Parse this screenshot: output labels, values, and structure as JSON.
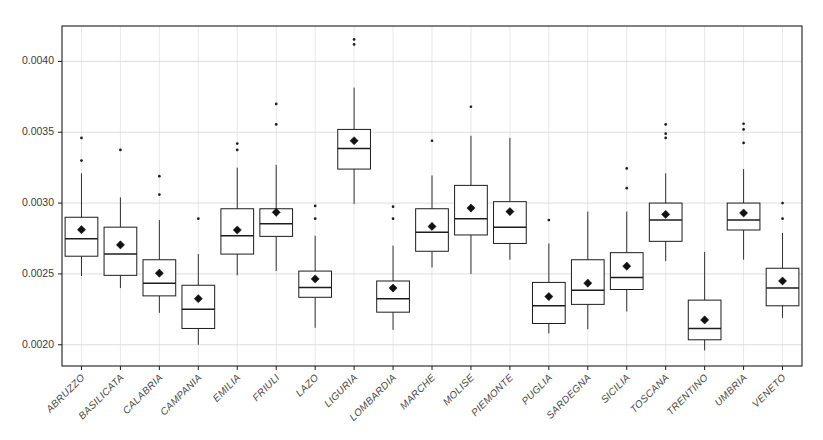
{
  "chart_data": {
    "type": "box",
    "title": "",
    "xlabel": "",
    "ylabel": "",
    "ylim": [
      0.00185,
      0.00425
    ],
    "yticks": [
      0.002,
      0.0025,
      0.003,
      0.0035,
      0.004
    ],
    "ytick_labels": [
      "0.0020",
      "0.0025",
      "0.0030",
      "0.0035",
      "0.0040"
    ],
    "grid": "horizontal-and-vertical",
    "legend": "none",
    "mean_marker": "filled-diamond",
    "categories": [
      "ABRUZZO",
      "BASILICATA",
      "CALABRIA",
      "CAMPANIA",
      "EMILIA",
      "FRIULI",
      "LAZO",
      "LIGURIA",
      "LOMBARDIA",
      "MARCHE",
      "MOLISE",
      "PIEMONTE",
      "PUGLIA",
      "SARDEGNA",
      "SICILIA",
      "TOSCANA",
      "TRENTINO",
      "UMBRIA",
      "VENETO"
    ],
    "boxes": [
      {
        "category": "ABRUZZO",
        "whisker_low": 0.002485,
        "q1": 0.002625,
        "median": 0.002748,
        "q3": 0.0029,
        "whisker_high": 0.00321,
        "mean": 0.002812,
        "outliers": [
          0.0033,
          0.00346
        ]
      },
      {
        "category": "BASILICATA",
        "whisker_low": 0.0024,
        "q1": 0.00249,
        "median": 0.00264,
        "q3": 0.00283,
        "whisker_high": 0.00304,
        "mean": 0.002705,
        "outliers": [
          0.003375
        ]
      },
      {
        "category": "CALABRIA",
        "whisker_low": 0.002225,
        "q1": 0.002345,
        "median": 0.002435,
        "q3": 0.0026,
        "whisker_high": 0.00288,
        "mean": 0.002505,
        "outliers": [
          0.00306,
          0.00319
        ]
      },
      {
        "category": "CAMPANIA",
        "whisker_low": 0.002,
        "q1": 0.002115,
        "median": 0.00225,
        "q3": 0.00242,
        "whisker_high": 0.00264,
        "mean": 0.002325,
        "outliers": [
          0.00289
        ]
      },
      {
        "category": "EMILIA",
        "whisker_low": 0.00249,
        "q1": 0.00264,
        "median": 0.00277,
        "q3": 0.00296,
        "whisker_high": 0.00325,
        "mean": 0.00281,
        "outliers": [
          0.003375,
          0.00342
        ]
      },
      {
        "category": "FRIULI",
        "whisker_low": 0.00252,
        "q1": 0.002765,
        "median": 0.002855,
        "q3": 0.00296,
        "whisker_high": 0.00327,
        "mean": 0.002935,
        "outliers": [
          0.003555,
          0.0037
        ]
      },
      {
        "category": "LAZO",
        "whisker_low": 0.00212,
        "q1": 0.002335,
        "median": 0.002405,
        "q3": 0.00252,
        "whisker_high": 0.00277,
        "mean": 0.002465,
        "outliers": [
          0.00289,
          0.00298
        ]
      },
      {
        "category": "LIGURIA",
        "whisker_low": 0.002995,
        "q1": 0.00324,
        "median": 0.003385,
        "q3": 0.00352,
        "whisker_high": 0.003815,
        "mean": 0.00344,
        "outliers": [
          0.00412,
          0.004155
        ]
      },
      {
        "category": "LOMBARDIA",
        "whisker_low": 0.002105,
        "q1": 0.00223,
        "median": 0.002325,
        "q3": 0.00245,
        "whisker_high": 0.0027,
        "mean": 0.0024,
        "outliers": [
          0.00289,
          0.002975
        ]
      },
      {
        "category": "MARCHE",
        "whisker_low": 0.002545,
        "q1": 0.00266,
        "median": 0.002795,
        "q3": 0.00296,
        "whisker_high": 0.003195,
        "mean": 0.002835,
        "outliers": [
          0.00344
        ]
      },
      {
        "category": "MOLISE",
        "whisker_low": 0.0025,
        "q1": 0.002775,
        "median": 0.00289,
        "q3": 0.003125,
        "whisker_high": 0.003475,
        "mean": 0.002965,
        "outliers": [
          0.00368
        ]
      },
      {
        "category": "PIEMONTE",
        "whisker_low": 0.0026,
        "q1": 0.002715,
        "median": 0.00283,
        "q3": 0.00301,
        "whisker_high": 0.00346,
        "mean": 0.00294,
        "outliers": []
      },
      {
        "category": "PUGLIA",
        "whisker_low": 0.00208,
        "q1": 0.00215,
        "median": 0.002275,
        "q3": 0.00244,
        "whisker_high": 0.002715,
        "mean": 0.00234,
        "outliers": [
          0.00288
        ]
      },
      {
        "category": "SARDEGNA",
        "whisker_low": 0.00211,
        "q1": 0.002285,
        "median": 0.002385,
        "q3": 0.0026,
        "whisker_high": 0.00294,
        "mean": 0.002435,
        "outliers": []
      },
      {
        "category": "SICILIA",
        "whisker_low": 0.002235,
        "q1": 0.00239,
        "median": 0.002475,
        "q3": 0.00265,
        "whisker_high": 0.00294,
        "mean": 0.002555,
        "outliers": [
          0.003105,
          0.003245
        ]
      },
      {
        "category": "TOSCANA",
        "whisker_low": 0.00259,
        "q1": 0.00273,
        "median": 0.00288,
        "q3": 0.003,
        "whisker_high": 0.00321,
        "mean": 0.00292,
        "outliers": [
          0.00346,
          0.00349,
          0.003555
        ]
      },
      {
        "category": "TRENTINO",
        "whisker_low": 0.00196,
        "q1": 0.002035,
        "median": 0.002115,
        "q3": 0.002315,
        "whisker_high": 0.002655,
        "mean": 0.002175,
        "outliers": []
      },
      {
        "category": "UMBRIA",
        "whisker_low": 0.0026,
        "q1": 0.00281,
        "median": 0.00288,
        "q3": 0.003,
        "whisker_high": 0.00324,
        "mean": 0.00293,
        "outliers": [
          0.003425,
          0.00352,
          0.00356
        ]
      },
      {
        "category": "VENETO",
        "whisker_low": 0.00219,
        "q1": 0.002275,
        "median": 0.0024,
        "q3": 0.00254,
        "whisker_high": 0.00279,
        "mean": 0.00245,
        "outliers": [
          0.00289,
          0.003
        ]
      }
    ]
  },
  "axes": {
    "plot_left": 62,
    "plot_right": 802,
    "plot_top": 26,
    "plot_bottom": 366
  },
  "colors": {
    "stroke": "#1c1c1c",
    "grid": "#cfcfcf",
    "background": "#ffffff",
    "tick_text": "#3a3a3a",
    "category_text": "#4a4a4a"
  }
}
